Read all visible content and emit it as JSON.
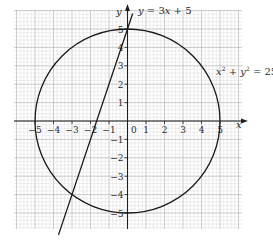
{
  "chart_data": {
    "type": "line",
    "title": "",
    "xlabel": "x",
    "ylabel": "y",
    "xlim": [
      -6,
      6
    ],
    "ylim": [
      -6,
      6
    ],
    "grid": true,
    "grid_minor_per_unit": 5,
    "origin_label": "0",
    "x_tick_labels": [
      "−5",
      "−4",
      "−3",
      "−2",
      "−1",
      "1",
      "2",
      "3",
      "4",
      "5"
    ],
    "x_tick_values": [
      -5,
      -4,
      -3,
      -2,
      -1,
      1,
      2,
      3,
      4,
      5
    ],
    "y_tick_labels": [
      "5",
      "4",
      "3",
      "2",
      "1",
      "−1",
      "−2",
      "−3",
      "−4",
      "−5"
    ],
    "y_tick_values": [
      5,
      4,
      3,
      2,
      1,
      -1,
      -2,
      -3,
      -4,
      -5
    ],
    "series": [
      {
        "name": "circle",
        "label": "x² + y² = 25",
        "kind": "circle",
        "center": [
          0,
          0
        ],
        "radius": 5
      },
      {
        "name": "line",
        "label": "y = 3x + 5",
        "kind": "line",
        "slope": 3,
        "intercept": 5,
        "x_range": [
          -3.73,
          0.28
        ]
      }
    ],
    "intersections": [
      [
        0,
        5
      ],
      [
        -3,
        -4
      ]
    ]
  },
  "labels": {
    "line_eq_y": "y",
    "line_eq_rest": " = 3",
    "line_eq_x": "x",
    "line_eq_end": " + 5",
    "circle_eq_x": "x",
    "circle_eq_plus": " + ",
    "circle_eq_y": "y",
    "circle_eq_end": " = 25",
    "sup": "2"
  },
  "colors": {
    "grid_minor": "#d4d4d4",
    "grid_major": "#b5b5b5",
    "axes": "#1e1e1e",
    "curve": "#1a1a1a",
    "text": "#2b2b2b"
  }
}
